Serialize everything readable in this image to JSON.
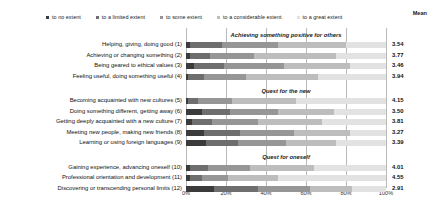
{
  "legend": {
    "items": [
      {
        "label": "to no  extent",
        "color": "#3b3b3b"
      },
      {
        "label": "to a limited extent",
        "color": "#6e6e6e"
      },
      {
        "label": "to some extent",
        "color": "#969696"
      },
      {
        "label": "to a considerable extent",
        "color": "#bdbdbd"
      },
      {
        "label": "to a great  extent",
        "color": "#e2e2e2"
      }
    ],
    "mean_header": "Mean"
  },
  "chart_data": {
    "type": "bar",
    "orientation": "horizontal",
    "stacked": true,
    "normalized": true,
    "title": "",
    "xlabel": "",
    "ylabel": "",
    "xlim": [
      0,
      100
    ],
    "xticks": [
      "0%",
      "20%",
      "40%",
      "60%",
      "80%",
      "100%"
    ],
    "xtick_values": [
      0,
      20,
      40,
      60,
      80,
      100
    ],
    "grid": true,
    "legend_position": "top",
    "series": [
      {
        "name": "to no  extent",
        "color": "#3b3b3b"
      },
      {
        "name": "to a limited extent",
        "color": "#6e6e6e"
      },
      {
        "name": "to some extent",
        "color": "#969696"
      },
      {
        "name": "to a considerable extent",
        "color": "#bdbdbd"
      },
      {
        "name": "to a great  extent",
        "color": "#e2e2e2"
      }
    ],
    "groups": [
      {
        "title": "Achieving something positive for others",
        "rows": [
          {
            "label": "Helping, giving, doing good (1)",
            "values": [
              2,
              16,
              28,
              34,
              20
            ],
            "mean": "3.54"
          },
          {
            "label": "Achieving or changing something (2)",
            "values": [
              2,
              10,
              22,
              41,
              25
            ],
            "mean": "3.77"
          },
          {
            "label": "Being geared to ethical values (3)",
            "values": [
              4,
              15,
              30,
              33,
              18
            ],
            "mean": "3.46"
          },
          {
            "label": "Feeling useful, doing something useful (4)",
            "values": [
              1,
              8,
              21,
              36,
              34
            ],
            "mean": "3.94"
          }
        ]
      },
      {
        "title": "Quest for the new",
        "rows": [
          {
            "label": "Becoming acquainted with new cultures (5)",
            "values": [
              1,
              5,
              17,
              32,
              45
            ],
            "mean": "4.15"
          },
          {
            "label": "Doing something different, getting away (6)",
            "values": [
              8,
              14,
              24,
              28,
              26
            ],
            "mean": "3.50"
          },
          {
            "label": "Getting deeply acquainted with a new culture (7)",
            "values": [
              3,
              10,
              23,
              32,
              32
            ],
            "mean": "3.81"
          },
          {
            "label": "Meeting new people, making new friends (8)",
            "values": [
              9,
              18,
              27,
              28,
              18
            ],
            "mean": "3.27"
          },
          {
            "label": "Learning or using foreign languages (9)",
            "values": [
              10,
              16,
              24,
              25,
              25
            ],
            "mean": "3.39"
          }
        ]
      },
      {
        "title": "Quest for oneself",
        "rows": [
          {
            "label": "Gaining experience, advancing oneself (10)",
            "values": [
              2,
              9,
              21,
              32,
              36
            ],
            "mean": "4.01"
          },
          {
            "label": "Professional orientation and development (11)",
            "values": [
              2,
              6,
              13,
              25,
              54
            ],
            "mean": "4.55"
          },
          {
            "label": "Discovering or transcending personal limits (12)",
            "values": [
              14,
              22,
              26,
              21,
              17
            ],
            "mean": "2.91"
          }
        ]
      }
    ]
  }
}
